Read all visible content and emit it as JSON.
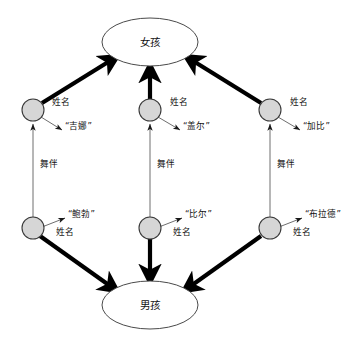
{
  "diagram": {
    "title_entities": {
      "girl": "女孩",
      "boy": "男孩"
    },
    "entities": [
      {
        "id": "girl-entity",
        "label": "女孩",
        "cx": 150,
        "cy": 42,
        "rx": 48,
        "ry": 24
      },
      {
        "id": "boy-entity",
        "label": "男孩",
        "cx": 150,
        "cy": 305,
        "rx": 48,
        "ry": 24
      }
    ],
    "nodes": [
      {
        "id": "girl-node-1",
        "cx": 33,
        "cy": 110,
        "r": 11,
        "name_label": "姓名",
        "value": "“吉娜”",
        "role": "girl"
      },
      {
        "id": "girl-node-2",
        "cx": 150,
        "cy": 110,
        "r": 11,
        "name_label": "姓名",
        "value": "“盖尔”",
        "role": "girl"
      },
      {
        "id": "girl-node-3",
        "cx": 270,
        "cy": 110,
        "r": 11,
        "name_label": "姓名",
        "value": "“加比”",
        "role": "girl"
      },
      {
        "id": "boy-node-1",
        "cx": 33,
        "cy": 228,
        "r": 11,
        "name_label": "姓名",
        "value": "“鲍勃”",
        "role": "boy"
      },
      {
        "id": "boy-node-2",
        "cx": 150,
        "cy": 228,
        "r": 11,
        "name_label": "姓名",
        "value": "“比尔”",
        "role": "boy"
      },
      {
        "id": "boy-node-3",
        "cx": 270,
        "cy": 228,
        "r": 11,
        "name_label": "姓名",
        "value": "“布拉德”",
        "role": "boy"
      }
    ],
    "partner_edges": [
      {
        "id": "partner-edge-1",
        "label": "舞伴",
        "from": "boy-node-1",
        "to": "girl-node-1"
      },
      {
        "id": "partner-edge-2",
        "label": "舞伴",
        "from": "boy-node-2",
        "to": "girl-node-2"
      },
      {
        "id": "partner-edge-3",
        "label": "舞伴",
        "from": "boy-node-3",
        "to": "girl-node-3"
      }
    ],
    "labels": {
      "name_attribute": "姓名",
      "partner_relation": "舞伴"
    },
    "text_items": [
      {
        "key": "girl-1-name",
        "text": "姓名",
        "x": 52,
        "y": 104
      },
      {
        "key": "girl-1-value",
        "text": "“吉娜”",
        "x": 65,
        "y": 127
      },
      {
        "key": "girl-2-name",
        "text": "姓名",
        "x": 170,
        "y": 104
      },
      {
        "key": "girl-2-value",
        "text": "“盖尔”",
        "x": 183,
        "y": 127
      },
      {
        "key": "girl-3-name",
        "text": "姓名",
        "x": 290,
        "y": 104
      },
      {
        "key": "girl-3-value",
        "text": "“加比”",
        "x": 303,
        "y": 127
      },
      {
        "key": "boy-1-value",
        "text": "“鲍勃”",
        "x": 68,
        "y": 216
      },
      {
        "key": "boy-1-name",
        "text": "姓名",
        "x": 56,
        "y": 233
      },
      {
        "key": "boy-2-value",
        "text": "“比尔”",
        "x": 185,
        "y": 216
      },
      {
        "key": "boy-2-name",
        "text": "姓名",
        "x": 173,
        "y": 233
      },
      {
        "key": "boy-3-value",
        "text": "“布拉德”",
        "x": 305,
        "y": 216
      },
      {
        "key": "boy-3-name",
        "text": "姓名",
        "x": 293,
        "y": 233
      },
      {
        "key": "partner-1",
        "text": "舞伴",
        "x": 40,
        "y": 164
      },
      {
        "key": "partner-2",
        "text": "舞伴",
        "x": 157,
        "y": 164
      },
      {
        "key": "partner-3",
        "text": "舞伴",
        "x": 277,
        "y": 164
      }
    ],
    "colors": {
      "node_fill": "#d6d6d6",
      "node_stroke": "#3a3a3a",
      "ellipse_stroke": "#4a4a4a",
      "thick_edge": "#000000",
      "thin_edge": "#6e6e6e",
      "background": "#ffffff",
      "text": "#111111"
    }
  }
}
